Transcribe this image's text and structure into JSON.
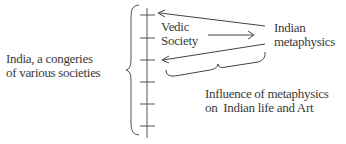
{
  "diagram": {
    "left_label": [
      "India, a congeries",
      "of various societies"
    ],
    "vedic_label": [
      "Vedic",
      "Society"
    ],
    "metaphysics_label": [
      "Indian",
      "metaphysics"
    ],
    "influence_label": [
      "Influence of metaphysics",
      "on  Indian life and Art"
    ],
    "tick_count": 6,
    "colors": {
      "ink": "#3a3a3a"
    }
  }
}
